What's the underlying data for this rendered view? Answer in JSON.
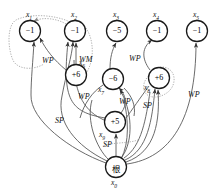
{
  "figure": {
    "type": "directed-graph",
    "title": "",
    "width": 223,
    "height": 194,
    "background": "#ffffff",
    "stroke": "#555555",
    "dotted_stroke": "#999999"
  },
  "nodes": [
    {
      "id": "x1",
      "value": "−1",
      "label": "x",
      "sub": "1",
      "cx": 30,
      "cy": 31,
      "r": 10.5,
      "label_pos": "top",
      "label_x": 26,
      "label_y": 10
    },
    {
      "id": "x2",
      "value": "−1",
      "label": "x",
      "sub": "2",
      "cx": 75,
      "cy": 31,
      "r": 10.5,
      "label_pos": "top",
      "label_x": 71,
      "label_y": 10
    },
    {
      "id": "x3",
      "value": "−5",
      "label": "x",
      "sub": "3",
      "cx": 117,
      "cy": 31,
      "r": 10.5,
      "label_pos": "top",
      "label_x": 113,
      "label_y": 10
    },
    {
      "id": "x4",
      "value": "−1",
      "label": "x",
      "sub": "4",
      "cx": 157,
      "cy": 31,
      "r": 10.5,
      "label_pos": "top",
      "label_x": 153,
      "label_y": 10
    },
    {
      "id": "x5",
      "value": "−1",
      "label": "x",
      "sub": "5",
      "cx": 197,
      "cy": 31,
      "r": 10.5,
      "label_pos": "top",
      "label_x": 193,
      "label_y": 10
    },
    {
      "id": "x6",
      "value": "+6",
      "label": "x",
      "sub": "6",
      "cx": 76,
      "cy": 75,
      "r": 10.5,
      "label_pos": "upleft",
      "label_x": 79,
      "label_y": 60
    },
    {
      "id": "x7",
      "value": "−6",
      "label": "x",
      "sub": "7",
      "cx": 113,
      "cy": 79,
      "r": 10.5,
      "label_pos": "left",
      "label_x": 98,
      "label_y": 86
    },
    {
      "id": "x8",
      "value": "+6",
      "label": "x",
      "sub": "8",
      "cx": 159,
      "cy": 78,
      "r": 10.5,
      "label_pos": "left",
      "label_x": 145,
      "label_y": 84
    },
    {
      "id": "x9",
      "value": "+5",
      "label": "x",
      "sub": "9",
      "cx": 115,
      "cy": 122,
      "r": 10.5,
      "label_pos": "left",
      "label_x": 100,
      "label_y": 131
    },
    {
      "id": "x0",
      "value": "根",
      "label": "x",
      "sub": "0",
      "cx": 116,
      "cy": 167,
      "r": 10.5,
      "label_pos": "bottom",
      "label_x": 112,
      "label_y": 179
    }
  ],
  "edge_labels": [
    {
      "text": "WP",
      "x": 42,
      "y": 56
    },
    {
      "text": "WM",
      "x": 79,
      "y": 55
    },
    {
      "text": "WP",
      "x": 129,
      "y": 54
    },
    {
      "text": "WP",
      "x": 80,
      "y": 93
    },
    {
      "text": "WP",
      "x": 120,
      "y": 98
    },
    {
      "text": "SP",
      "x": 143,
      "y": 101
    },
    {
      "text": "WP",
      "x": 189,
      "y": 91
    },
    {
      "text": "SP",
      "x": 56,
      "y": 117
    },
    {
      "text": "SP",
      "x": 104,
      "y": 141
    }
  ],
  "edges": [
    {
      "from": "x6",
      "to": "x1",
      "label": "WP",
      "style": "solid"
    },
    {
      "from": "x6",
      "to": "x2",
      "label": "WM",
      "style": "solid"
    },
    {
      "from": "x2",
      "to": "x1",
      "label": "",
      "style": "dotted"
    },
    {
      "from": "x2",
      "to": "x2",
      "label": "",
      "style": "dotted"
    },
    {
      "from": "x7",
      "to": "x3",
      "label": "",
      "style": "solid"
    },
    {
      "from": "x8",
      "to": "x4",
      "label": "WP",
      "style": "solid"
    },
    {
      "from": "x8",
      "to": "x8",
      "label": "SP",
      "style": "dotted"
    },
    {
      "from": "x9",
      "to": "x7",
      "label": "WP",
      "style": "solid"
    },
    {
      "from": "x9",
      "to": "x2",
      "label": "WP",
      "style": "solid"
    },
    {
      "from": "x0",
      "to": "x9",
      "label": "SP",
      "style": "solid"
    },
    {
      "from": "x0",
      "to": "x1",
      "label": "SP",
      "style": "solid"
    },
    {
      "from": "x0",
      "to": "x2",
      "label": "",
      "style": "solid"
    },
    {
      "from": "x0",
      "to": "x5",
      "label": "WP",
      "style": "solid"
    },
    {
      "from": "x0",
      "to": "x8",
      "label": "SP",
      "style": "solid"
    },
    {
      "from": "x0",
      "to": "x7",
      "label": "",
      "style": "solid"
    },
    {
      "from": "x0",
      "to": "x4",
      "label": "",
      "style": "solid"
    }
  ]
}
